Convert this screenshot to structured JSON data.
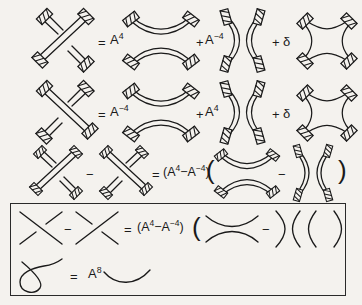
{
  "figure": {
    "kind": "kauffman-bracket-skein-relations",
    "background_color": "#f4f2ee",
    "ink_color": "#1a1a1a",
    "width": 362,
    "height": 305
  },
  "rows": [
    {
      "id": "row1",
      "label": "framed-skein-relation-positive-crossing",
      "tokens": {
        "equals": "=",
        "coef1": "A",
        "coef1_exp": "4",
        "plus1": "+",
        "coef2": "A",
        "coef2_exp": "−4",
        "plus2": "+",
        "delta": "δ"
      },
      "diagrams": [
        "ribbon-crossing-positive",
        "ribbon-horizontal-smoothing",
        "ribbon-vertical-smoothing",
        "ribbon-square-cushion"
      ]
    },
    {
      "id": "row2",
      "label": "framed-skein-relation-negative-crossing",
      "tokens": {
        "equals": "=",
        "coef1": "A",
        "coef1_exp": "−4",
        "plus1": "+",
        "coef2": "A",
        "coef2_exp": "4",
        "plus2": "+",
        "delta": "δ"
      },
      "diagrams": [
        "ribbon-crossing-negative",
        "ribbon-horizontal-smoothing",
        "ribbon-vertical-smoothing",
        "ribbon-square-cushion"
      ]
    },
    {
      "id": "row3",
      "label": "framed-skein-difference-relation",
      "tokens": {
        "minus1": "−",
        "equals": "=",
        "lparen_coef": "(",
        "coefA": "A",
        "coefA_exp": "4",
        "coef_minus": "−",
        "coefB": "A",
        "coefB_exp": "−4",
        "rparen_coef": ")",
        "lparen_big": "(",
        "minus2": "−",
        "rparen_big": ")"
      },
      "diagrams": [
        "ribbon-crossing-positive",
        "ribbon-crossing-negative",
        "ribbon-horizontal-smoothing",
        "ribbon-vertical-smoothing"
      ]
    }
  ],
  "boxed": {
    "label": "unframed-skein-relations-box",
    "border_color": "#2a2a2a",
    "line1": {
      "label": "unframed-skein-difference-relation",
      "tokens": {
        "minus1": "−",
        "equals": "=",
        "lparen_coef": "(",
        "coefA": "A",
        "coefA_exp": "4",
        "coef_minus": "−",
        "coefB": "A",
        "coefB_exp": "−4",
        "rparen_coef": ")",
        "lparen_big": "(",
        "minus2": "−",
        "rparen_big": ")",
        "lparen_tail": "(",
        "rparen_tail": ")"
      },
      "diagrams": [
        "plain-crossing-positive",
        "plain-crossing-negative",
        "plain-horizontal-smoothing",
        "plain-vertical-smoothing"
      ]
    },
    "line2": {
      "label": "curl-framing-relation",
      "tokens": {
        "equals": "=",
        "coef": "A",
        "coef_exp": "8"
      },
      "diagrams": [
        "plain-curl-kink",
        "plain-arc"
      ]
    }
  }
}
